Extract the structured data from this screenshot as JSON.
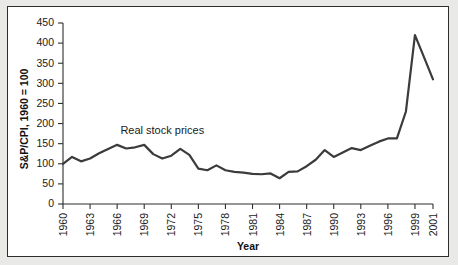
{
  "chart_data": {
    "type": "line",
    "title": "",
    "xlabel": "Year",
    "ylabel": "S&P/CPI, 1960 = 100",
    "xlim": [
      1960,
      2001
    ],
    "ylim": [
      0,
      450
    ],
    "grid": false,
    "legend_position": "inline-annotation",
    "annotations": [
      {
        "text": "Real stock prices",
        "x": 1971,
        "y": 175
      }
    ],
    "ytick_labels": [
      "0",
      "50",
      "100",
      "150",
      "200",
      "250",
      "300",
      "350",
      "400",
      "450"
    ],
    "ytick_values": [
      0,
      50,
      100,
      150,
      200,
      250,
      300,
      350,
      400,
      450
    ],
    "xtick_labels": [
      "1960",
      "1963",
      "1966",
      "1969",
      "1972",
      "1975",
      "1978",
      "1981",
      "1984",
      "1987",
      "1990",
      "1993",
      "1996",
      "1999",
      "2001"
    ],
    "xtick_values": [
      1960,
      1963,
      1966,
      1969,
      1972,
      1975,
      1978,
      1981,
      1984,
      1987,
      1990,
      1993,
      1996,
      1999,
      2001
    ],
    "series": [
      {
        "name": "Real stock prices",
        "color": "#3b3b3b",
        "x": [
          1960,
          1961,
          1962,
          1963,
          1964,
          1965,
          1966,
          1967,
          1968,
          1969,
          1970,
          1971,
          1972,
          1973,
          1974,
          1975,
          1976,
          1977,
          1978,
          1979,
          1980,
          1981,
          1982,
          1983,
          1984,
          1985,
          1986,
          1987,
          1988,
          1989,
          1990,
          1991,
          1992,
          1993,
          1994,
          1995,
          1996,
          1997,
          1998,
          1999,
          2000,
          2001
        ],
        "values": [
          100,
          117,
          106,
          113,
          126,
          137,
          147,
          138,
          141,
          147,
          124,
          113,
          120,
          137,
          122,
          88,
          84,
          96,
          84,
          80,
          78,
          75,
          74,
          76,
          64,
          80,
          81,
          94,
          110,
          134,
          117,
          128,
          139,
          134,
          145,
          155,
          163,
          163,
          230,
          420,
          365,
          310
        ]
      }
    ]
  },
  "axis": {
    "ylabel_text": "S&P/CPI, 1960 = 100",
    "xlabel_text": "Year"
  },
  "annotation": {
    "series_label": "Real stock prices"
  }
}
